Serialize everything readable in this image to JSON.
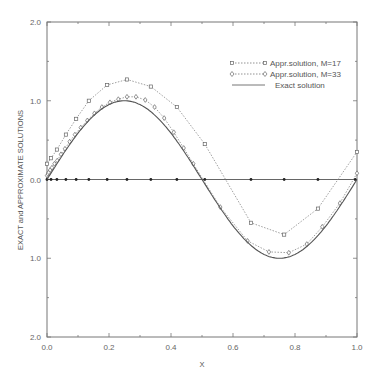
{
  "chart_data": {
    "type": "line",
    "title": "",
    "xlabel": "X",
    "ylabel": "EXACT and APPROXIMATE SOLUTIONS",
    "xlim": [
      0.0,
      1.0
    ],
    "ylim": [
      -2.0,
      2.0
    ],
    "x_ticks": [
      "0.0",
      "0.2",
      "0.4",
      "0.6",
      "0.8",
      "1.0"
    ],
    "y_ticks": [
      "2.0",
      "1.0",
      "0.0",
      "1.0",
      "2.0"
    ],
    "grid": false,
    "legend_position": "upper right",
    "series": [
      {
        "name": "Appr.solution, M=17",
        "marker": "square",
        "linestyle": "dotted",
        "x": [
          0.0,
          0.013,
          0.032,
          0.061,
          0.094,
          0.135,
          0.194,
          0.258,
          0.335,
          0.419,
          0.509,
          0.658,
          0.765,
          0.874,
          1.0
        ],
        "y": [
          0.2,
          0.27,
          0.38,
          0.57,
          0.77,
          1.0,
          1.2,
          1.27,
          1.18,
          0.92,
          0.45,
          -0.55,
          -0.7,
          -0.37,
          0.35
        ]
      },
      {
        "name": "Appr.solution, M=33",
        "marker": "diamond",
        "linestyle": "dotted",
        "x": [
          0.0,
          0.003,
          0.006,
          0.01,
          0.016,
          0.024,
          0.033,
          0.045,
          0.058,
          0.073,
          0.09,
          0.109,
          0.13,
          0.153,
          0.177,
          0.203,
          0.23,
          0.258,
          0.287,
          0.317,
          0.347,
          0.378,
          0.409,
          0.441,
          0.472,
          0.559,
          0.647,
          0.716,
          0.78,
          0.838,
          0.888,
          0.945,
          1.0
        ],
        "y": [
          0.05,
          0.07,
          0.09,
          0.12,
          0.15,
          0.2,
          0.24,
          0.32,
          0.39,
          0.48,
          0.57,
          0.66,
          0.75,
          0.84,
          0.92,
          0.98,
          1.02,
          1.05,
          1.05,
          1.01,
          0.92,
          0.78,
          0.6,
          0.4,
          0.2,
          -0.35,
          -0.78,
          -0.92,
          -0.93,
          -0.82,
          -0.6,
          -0.3,
          0.08
        ]
      },
      {
        "name": "Exact solution",
        "marker": "none",
        "linestyle": "solid",
        "function": "sin(2*pi*x)"
      }
    ],
    "nodes": {
      "name": "collocation points",
      "marker": "dot",
      "y": 0.0,
      "x": [
        0.0,
        0.013,
        0.032,
        0.061,
        0.094,
        0.135,
        0.194,
        0.258,
        0.335,
        0.419,
        0.509,
        0.658,
        0.765,
        0.874,
        0.994
      ]
    }
  },
  "legend": {
    "items": [
      {
        "label": "Appr.solution, M=17"
      },
      {
        "label": "Appr.solution, M=33"
      },
      {
        "label": "Exact solution"
      }
    ]
  },
  "axes": {
    "xlabel": "X",
    "ylabel": "EXACT and APPROXIMATE SOLUTIONS"
  }
}
